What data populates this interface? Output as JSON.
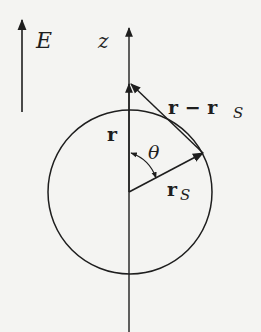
{
  "diagram": {
    "field_label": "E",
    "axis_label": "z",
    "vector_r_label": "r",
    "vector_rs_label": "r",
    "vector_rs_subscript": "S",
    "vector_diff_label": "r − r",
    "vector_diff_subscript": "S",
    "angle_label": "θ"
  },
  "colors": {
    "ink": "#1e1e1e",
    "background": "#f4f4f2"
  }
}
